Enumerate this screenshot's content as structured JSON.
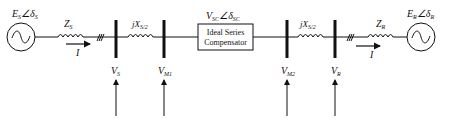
{
  "diagram": {
    "source": {
      "voltage_label": "E",
      "voltage_sub": "S",
      "angle_symbol": "∠δ",
      "angle_sub": "S",
      "impedance_label": "Z",
      "impedance_sub": "S",
      "current_label": "I"
    },
    "receiver": {
      "voltage_label": "E",
      "voltage_sub": "R",
      "angle_symbol": "∠δ",
      "angle_sub": "R",
      "impedance_label": "Z",
      "impedance_sub": "R",
      "current_label": "I"
    },
    "line_reactance_left": {
      "label": "jX",
      "sub": "S/2"
    },
    "line_reactance_right": {
      "label": "jX",
      "sub": "S/2"
    },
    "compensator": {
      "line1": "Ideal Series",
      "line2": "Compensator",
      "voltage_label": "V",
      "voltage_sub": "SC",
      "angle_symbol": "∠δ",
      "angle_sub": "SC"
    },
    "buses": [
      {
        "label": "V",
        "sub": "S"
      },
      {
        "label": "V",
        "sub": "M1"
      },
      {
        "label": "V",
        "sub": "M2"
      },
      {
        "label": "V",
        "sub": "R"
      }
    ]
  }
}
